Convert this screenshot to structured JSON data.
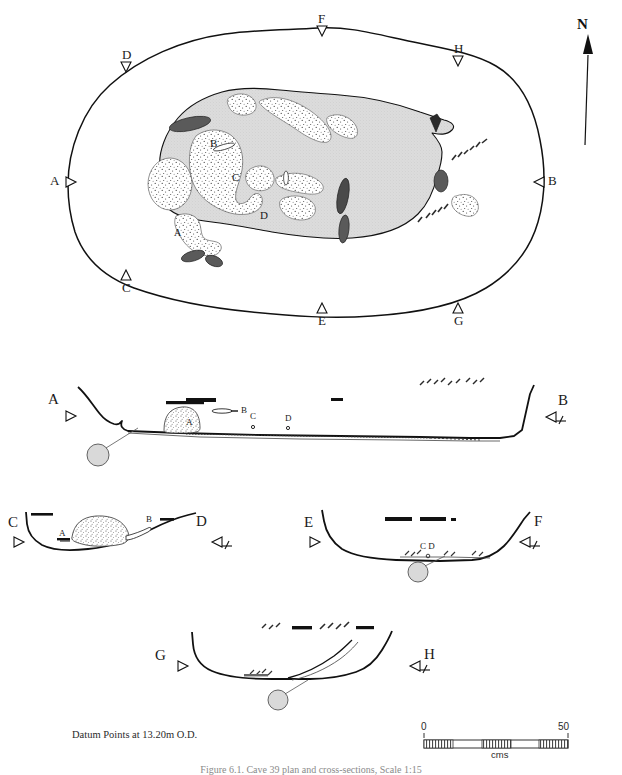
{
  "figure": {
    "type": "archaeological-site-plan-and-sections",
    "caption": "Figure 6.1. Cave 39 plan and cross-sections, Scale 1:15",
    "datum_note": "Datum Points at 13.20m O.D.",
    "north_label": "N"
  },
  "scale_bar": {
    "min_label": "0",
    "max_label": "50",
    "unit_label": "cms",
    "segments": 5,
    "fill_pattern": [
      "hatch",
      "white",
      "hatch",
      "white",
      "hatch"
    ]
  },
  "plan": {
    "name": "plan-view",
    "section_markers": [
      {
        "id": "A",
        "label": "A",
        "x": 58,
        "y": 181,
        "direction": "right"
      },
      {
        "id": "B",
        "label": "B",
        "x": 540,
        "y": 181,
        "direction": "left"
      },
      {
        "id": "C",
        "label": "C",
        "x": 124,
        "y": 275,
        "direction": "up"
      },
      {
        "id": "D",
        "label": "D",
        "x": 124,
        "y": 60,
        "direction": "down"
      },
      {
        "id": "E",
        "label": "E",
        "x": 320,
        "y": 308,
        "direction": "up"
      },
      {
        "id": "F",
        "label": "F",
        "x": 320,
        "y": 18,
        "direction": "down"
      },
      {
        "id": "G",
        "label": "G",
        "x": 458,
        "y": 308,
        "direction": "up"
      },
      {
        "id": "H",
        "label": "H",
        "x": 458,
        "y": 52,
        "direction": "down"
      }
    ],
    "feature_labels": [
      {
        "label": "B",
        "x": 214,
        "y": 144
      },
      {
        "label": "C",
        "x": 236,
        "y": 178
      },
      {
        "label": "D",
        "x": 263,
        "y": 216
      },
      {
        "label": "A",
        "x": 177,
        "y": 233
      }
    ]
  },
  "sections": [
    {
      "id": "AB",
      "name": "section-a-b",
      "left": {
        "label": "A",
        "direction": "right"
      },
      "right": {
        "label": "B",
        "direction": "left"
      },
      "inner_labels": [
        {
          "label": "A",
          "x": 188,
          "y": 421
        },
        {
          "label": "B",
          "x": 233,
          "y": 411
        },
        {
          "label": "C",
          "x": 252,
          "y": 418
        },
        {
          "label": "D",
          "x": 288,
          "y": 416
        }
      ],
      "datum_circle": true
    },
    {
      "id": "CD",
      "name": "section-c-d",
      "left": {
        "label": "C",
        "direction": "right"
      },
      "right": {
        "label": "D",
        "direction": "left"
      },
      "inner_labels": [
        {
          "label": "A",
          "x": 62,
          "y": 534
        },
        {
          "label": "B",
          "x": 142,
          "y": 521
        }
      ],
      "datum_circle": false
    },
    {
      "id": "EF",
      "name": "section-e-f",
      "left": {
        "label": "E",
        "direction": "right"
      },
      "right": {
        "label": "F",
        "direction": "left"
      },
      "inner_labels": [
        {
          "label": "C D",
          "x": 428,
          "y": 538
        }
      ],
      "datum_circle": true
    },
    {
      "id": "GH",
      "name": "section-g-h",
      "left": {
        "label": "G",
        "direction": "right"
      },
      "right": {
        "label": "H",
        "direction": "left"
      },
      "inner_labels": [],
      "datum_circle": true
    }
  ],
  "colors": {
    "line": "#111111",
    "shaded_fill": "#d6d6d6",
    "stipple_fill": "#ffffff",
    "dark_feature": "#555555",
    "black_feature": "#111111",
    "datum_circle": "#d9d9d9",
    "paper": "#ffffff"
  }
}
